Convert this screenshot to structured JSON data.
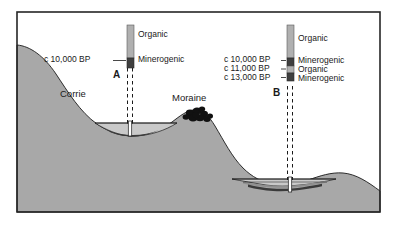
{
  "figure": {
    "frame": {
      "x": 17,
      "y": 12,
      "width": 363,
      "height": 200,
      "border_color": "#262626"
    },
    "colors": {
      "bedrock": "#a8a8a8",
      "sediment_light": "#c9c9c9",
      "sediment_mid": "#8f8f8f",
      "sediment_dark": "#3a3a3a",
      "organic": "#b0b0b0",
      "minerogenic": "#3f3f3f",
      "background": "#ffffff",
      "line": "#1a1a1a"
    }
  },
  "features": [
    {
      "name": "corrie",
      "label": "Corrie",
      "x": 73,
      "y": 93
    },
    {
      "name": "moraine",
      "label": "Moraine",
      "x": 188,
      "y": 97
    }
  ],
  "cores": [
    {
      "id": "A",
      "label": "A",
      "label_x": 115,
      "label_y": 68,
      "column_x": 127,
      "column_y": 25,
      "column_width": 7,
      "column_height": 43,
      "layers": [
        {
          "name": "Organic",
          "label": "Organic",
          "type": "organic",
          "top": 25,
          "height": 33
        },
        {
          "name": "Minerogenic",
          "label": "Minerogenic",
          "type": "minerogenic",
          "top": 58,
          "height": 10
        }
      ],
      "layer_labels": [
        {
          "label": "Organic",
          "x": 138,
          "y": 34
        },
        {
          "label": "Minerogenic",
          "x": 138,
          "y": 59
        }
      ],
      "dates": [
        {
          "label": "c 10,000 BP",
          "x": 44,
          "y": 59,
          "tick_y": 59
        }
      ]
    },
    {
      "id": "B",
      "label": "B",
      "label_x": 275,
      "label_y": 86,
      "column_x": 287,
      "column_y": 25,
      "column_width": 7,
      "column_height": 55,
      "layers": [
        {
          "name": "Organic",
          "label": "Organic",
          "type": "organic",
          "top": 25,
          "height": 33
        },
        {
          "name": "Minerogenic",
          "label": "Minerogenic",
          "type": "minerogenic",
          "top": 58,
          "height": 8
        },
        {
          "name": "Organic",
          "label": "Organic",
          "type": "organic",
          "top": 66,
          "height": 7
        },
        {
          "name": "Minerogenic",
          "label": "Minerogenic",
          "type": "minerogenic",
          "top": 73,
          "height": 8
        }
      ],
      "layer_labels": [
        {
          "label": "Organic",
          "x": 298,
          "y": 38
        },
        {
          "label": "Minerogenic",
          "x": 298,
          "y": 60
        },
        {
          "label": "Organic",
          "x": 298,
          "y": 69
        },
        {
          "label": "Minerogenic",
          "x": 298,
          "y": 77
        }
      ],
      "dates": [
        {
          "label": "c 10,000 BP",
          "x": 224,
          "y": 59,
          "tick_y": 59
        },
        {
          "label": "c 11,000 BP",
          "x": 224,
          "y": 68,
          "tick_y": 68
        },
        {
          "label": "c 13,000 BP",
          "x": 224,
          "y": 77,
          "tick_y": 77
        }
      ]
    }
  ],
  "basins": [
    {
      "name": "corrie-basin",
      "core_id": "A",
      "fill_layers": [
        {
          "type": "sediment_light",
          "label": "upper fill"
        },
        {
          "type": "sediment_dark",
          "label": "basal minerogenic"
        }
      ]
    },
    {
      "name": "lower-basin",
      "core_id": "B",
      "fill_layers": [
        {
          "type": "sediment_light",
          "label": "upper fill"
        },
        {
          "type": "sediment_mid",
          "label": "middle fill"
        },
        {
          "type": "sediment_dark",
          "label": "basal minerogenic"
        }
      ]
    }
  ]
}
